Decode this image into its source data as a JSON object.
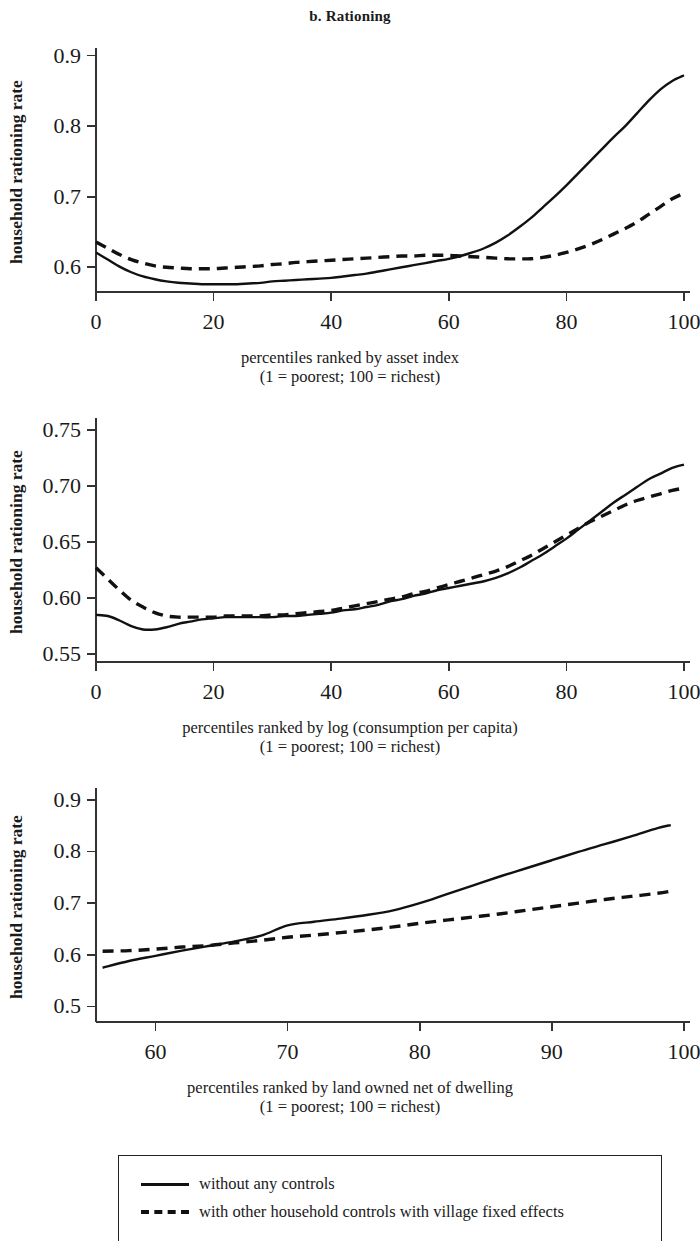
{
  "figure": {
    "title": "b. Rationing"
  },
  "legend": {
    "items": [
      {
        "style": "solid",
        "label": "without any controls"
      },
      {
        "style": "dashed",
        "label": "with other household controls with village fixed effects"
      }
    ]
  },
  "chart_data": [
    {
      "type": "line",
      "title": "b. Rationing",
      "panel": "1",
      "xlabel": "percentiles ranked by asset index",
      "xlabel_line2": "(1 = poorest; 100 = richest)",
      "ylabel": "household rationing rate",
      "xlim": [
        0,
        100
      ],
      "ylim": [
        0.565,
        0.905
      ],
      "xticks": [
        0,
        20,
        40,
        60,
        80,
        100
      ],
      "xticklabels": [
        "0",
        "20",
        "40",
        "60",
        "80",
        "100"
      ],
      "yticks": [
        0.6,
        0.7,
        0.8,
        0.9
      ],
      "yticklabels": [
        "0.6",
        "0.7",
        "0.8",
        "0.9"
      ],
      "grid": false,
      "legend_position": "below figure",
      "x": [
        0,
        2,
        4,
        6,
        8,
        10,
        12,
        14,
        16,
        18,
        20,
        22,
        24,
        26,
        28,
        30,
        32,
        34,
        36,
        38,
        40,
        42,
        44,
        46,
        48,
        50,
        52,
        54,
        56,
        58,
        60,
        62,
        64,
        66,
        68,
        70,
        72,
        74,
        76,
        78,
        80,
        82,
        84,
        86,
        88,
        90,
        92,
        94,
        96,
        98,
        100
      ],
      "series": [
        {
          "name": "without any controls",
          "style": "solid",
          "values": [
            0.621,
            0.611,
            0.601,
            0.593,
            0.587,
            0.583,
            0.58,
            0.578,
            0.577,
            0.576,
            0.576,
            0.576,
            0.576,
            0.577,
            0.578,
            0.58,
            0.581,
            0.582,
            0.583,
            0.584,
            0.585,
            0.587,
            0.589,
            0.591,
            0.594,
            0.597,
            0.6,
            0.603,
            0.606,
            0.609,
            0.612,
            0.616,
            0.621,
            0.627,
            0.635,
            0.645,
            0.657,
            0.67,
            0.685,
            0.7,
            0.716,
            0.733,
            0.75,
            0.767,
            0.784,
            0.8,
            0.818,
            0.836,
            0.852,
            0.864,
            0.872
          ]
        },
        {
          "name": "with other household controls with village fixed effects",
          "style": "dashed",
          "values": [
            0.636,
            0.627,
            0.618,
            0.611,
            0.606,
            0.602,
            0.6,
            0.599,
            0.598,
            0.598,
            0.598,
            0.599,
            0.6,
            0.601,
            0.602,
            0.604,
            0.605,
            0.607,
            0.608,
            0.609,
            0.61,
            0.611,
            0.612,
            0.613,
            0.614,
            0.615,
            0.616,
            0.616,
            0.617,
            0.617,
            0.617,
            0.616,
            0.615,
            0.614,
            0.613,
            0.612,
            0.612,
            0.612,
            0.614,
            0.617,
            0.621,
            0.626,
            0.632,
            0.639,
            0.647,
            0.655,
            0.664,
            0.675,
            0.686,
            0.697,
            0.705
          ]
        }
      ]
    },
    {
      "type": "line",
      "panel": "2",
      "xlabel": "percentiles ranked by log (consumption per capita)",
      "xlabel_line2": "(1 = poorest; 100 = richest)",
      "ylabel": "household rationing rate",
      "xlim": [
        0,
        100
      ],
      "ylim": [
        0.543,
        0.757
      ],
      "xticks": [
        0,
        20,
        40,
        60,
        80,
        100
      ],
      "xticklabels": [
        "0",
        "20",
        "40",
        "60",
        "80",
        "100"
      ],
      "yticks": [
        0.55,
        0.6,
        0.65,
        0.7,
        0.75
      ],
      "yticklabels": [
        "0.55",
        "0.60",
        "0.65",
        "0.70",
        "0.75"
      ],
      "grid": false,
      "legend_position": "below figure",
      "x": [
        0,
        2,
        4,
        6,
        8,
        10,
        12,
        14,
        16,
        18,
        20,
        22,
        24,
        26,
        28,
        30,
        32,
        34,
        36,
        38,
        40,
        42,
        44,
        46,
        48,
        50,
        52,
        54,
        56,
        58,
        60,
        62,
        64,
        66,
        68,
        70,
        72,
        74,
        76,
        78,
        80,
        82,
        84,
        86,
        88,
        90,
        92,
        94,
        96,
        98,
        100
      ],
      "series": [
        {
          "name": "without any controls",
          "style": "solid",
          "values": [
            0.585,
            0.584,
            0.58,
            0.575,
            0.572,
            0.572,
            0.574,
            0.577,
            0.579,
            0.581,
            0.582,
            0.583,
            0.583,
            0.583,
            0.583,
            0.583,
            0.584,
            0.584,
            0.585,
            0.586,
            0.587,
            0.589,
            0.59,
            0.592,
            0.594,
            0.597,
            0.599,
            0.602,
            0.604,
            0.607,
            0.609,
            0.611,
            0.613,
            0.615,
            0.618,
            0.622,
            0.627,
            0.633,
            0.639,
            0.646,
            0.653,
            0.661,
            0.669,
            0.677,
            0.685,
            0.692,
            0.699,
            0.706,
            0.711,
            0.716,
            0.719
          ]
        },
        {
          "name": "with other household controls with village fixed effects",
          "style": "dashed",
          "values": [
            0.627,
            0.617,
            0.607,
            0.598,
            0.592,
            0.587,
            0.584,
            0.583,
            0.583,
            0.583,
            0.583,
            0.584,
            0.584,
            0.584,
            0.584,
            0.585,
            0.585,
            0.586,
            0.587,
            0.588,
            0.589,
            0.591,
            0.593,
            0.595,
            0.597,
            0.599,
            0.601,
            0.604,
            0.606,
            0.609,
            0.612,
            0.615,
            0.618,
            0.621,
            0.624,
            0.628,
            0.633,
            0.638,
            0.644,
            0.65,
            0.656,
            0.662,
            0.668,
            0.673,
            0.678,
            0.683,
            0.687,
            0.69,
            0.693,
            0.696,
            0.698
          ]
        }
      ]
    },
    {
      "type": "line",
      "panel": "3",
      "xlabel": "percentiles ranked by land owned net of dwelling",
      "xlabel_line2": "(1 = poorest; 100 = richest)",
      "ylabel": "household rationing rate",
      "xlim": [
        55.5,
        100
      ],
      "ylim": [
        0.47,
        0.915
      ],
      "xticks": [
        60,
        70,
        80,
        90,
        100
      ],
      "xticklabels": [
        "60",
        "70",
        "80",
        "90",
        "100"
      ],
      "yticks": [
        0.5,
        0.6,
        0.7,
        0.8,
        0.9
      ],
      "yticklabels": [
        "0.5",
        "0.6",
        "0.7",
        "0.8",
        "0.9"
      ],
      "grid": false,
      "legend_position": "below figure",
      "x": [
        56,
        58,
        60,
        62,
        64,
        66,
        68,
        70,
        72,
        74,
        76,
        78,
        80,
        82,
        84,
        86,
        88,
        90,
        92,
        94,
        96,
        98,
        99
      ],
      "series": [
        {
          "name": "without any controls",
          "style": "solid",
          "values": [
            0.575,
            0.588,
            0.598,
            0.608,
            0.617,
            0.626,
            0.637,
            0.657,
            0.664,
            0.67,
            0.677,
            0.686,
            0.7,
            0.717,
            0.734,
            0.751,
            0.767,
            0.783,
            0.799,
            0.814,
            0.829,
            0.845,
            0.851
          ]
        },
        {
          "name": "with other household controls with village fixed effects",
          "style": "dashed",
          "values": [
            0.607,
            0.608,
            0.611,
            0.615,
            0.618,
            0.623,
            0.628,
            0.634,
            0.638,
            0.643,
            0.648,
            0.654,
            0.661,
            0.667,
            0.673,
            0.679,
            0.686,
            0.693,
            0.7,
            0.707,
            0.713,
            0.719,
            0.723
          ]
        }
      ]
    }
  ]
}
